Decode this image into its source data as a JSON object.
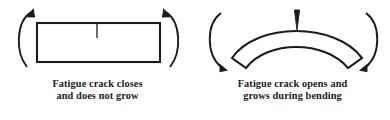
{
  "figure": {
    "background_color": "#ffffff",
    "line_color": "#1c1c1c",
    "text_color": "#1a1a1a",
    "width": 390,
    "height": 120
  },
  "panels": [
    {
      "id": "closed",
      "specimen_shape": "straight-rectangular-beam",
      "crack_state": "closed",
      "crack_label": "vertical-crack-line",
      "moment_direction": "arrows-point-upward-inward",
      "caption_line1": "Fatigue crack closes",
      "caption_line2": "and does not grow"
    },
    {
      "id": "open",
      "specimen_shape": "upward-curved-bent-beam",
      "crack_state": "open",
      "crack_label": "wedge-crack-opening",
      "moment_direction": "arrows-point-downward-inward",
      "caption_line1": "Fatigue crack opens and",
      "caption_line2": "grows during bending"
    }
  ]
}
